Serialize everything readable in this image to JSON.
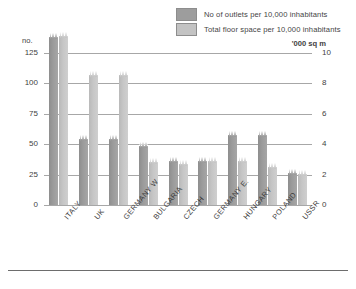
{
  "legend": {
    "items": [
      {
        "label": "No of outlets per 10,000 inhabitants",
        "swatch": "dark-grey-swatch",
        "color": "#9d9d9d"
      },
      {
        "label": "Total floor space per 10,000 inhabitants",
        "swatch": "light-grey-swatch",
        "color": "#c3c3c3"
      }
    ]
  },
  "axes": {
    "left_title": "no.",
    "right_title": "'000 sq m",
    "left_ticks": [
      "125",
      "100",
      "75",
      "50",
      "25",
      "0"
    ],
    "right_ticks": [
      "10",
      "8",
      "6",
      "4",
      "2",
      "0"
    ]
  },
  "chart_data": {
    "type": "bar",
    "title": "",
    "xlabel": "",
    "ylabel": "no.",
    "y2label": "'000 sq m",
    "ylim": [
      0,
      125
    ],
    "y2lim": [
      0,
      10
    ],
    "grid": true,
    "legend_position": "top-right",
    "categories": [
      "ITALY",
      "UK",
      "GERMANY W",
      "BULGARIA",
      "CZECH",
      "GERMANY E.",
      "HUNGARY",
      "POLAND",
      "USSR"
    ],
    "series": [
      {
        "name": "No of outlets per 10,000 inhabitants",
        "axis": "left",
        "units": "no.",
        "color": "#9d9d9d",
        "values": [
          132,
          48,
          48,
          42,
          30,
          30,
          51,
          51,
          20
        ]
      },
      {
        "name": "Total floor space per 10,000 inhabitants",
        "axis": "right",
        "units": "'000 sq m",
        "color": "#c3c3c3",
        "values": [
          10.6,
          8.0,
          8.0,
          2.3,
          2.2,
          2.4,
          2.4,
          2.0,
          1.5
        ]
      }
    ]
  }
}
